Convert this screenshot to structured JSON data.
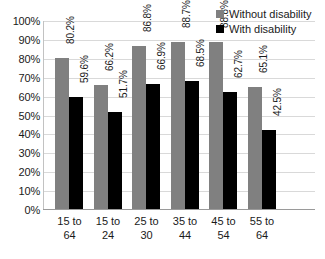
{
  "chart_data": {
    "type": "bar",
    "title": "",
    "xlabel": "",
    "ylabel": "",
    "categories": [
      "15 to 64",
      "15 to 24",
      "25 to 30",
      "35 to 44",
      "45 to 54",
      "55 to 64"
    ],
    "category_lines": [
      [
        "15 to",
        "64"
      ],
      [
        "15 to",
        "24"
      ],
      [
        "25 to",
        "30"
      ],
      [
        "35 to",
        "44"
      ],
      [
        "45 to",
        "54"
      ],
      [
        "55 to",
        "64"
      ]
    ],
    "series": [
      {
        "name": "Without disability",
        "color": "#808080",
        "values": [
          80.2,
          66.2,
          86.8,
          88.7,
          88.8,
          65.1
        ],
        "labels": [
          "80.2%",
          "66.2%",
          "86.8%",
          "88.7%",
          "88.8%",
          "65.1%"
        ]
      },
      {
        "name": "With disability",
        "color": "#000000",
        "values": [
          59.6,
          51.7,
          66.9,
          68.5,
          62.7,
          42.5
        ],
        "labels": [
          "59.6%",
          "51.7%",
          "66.9%",
          "68.5%",
          "62.7%",
          "42.5%"
        ]
      }
    ],
    "ylim": [
      0,
      100
    ],
    "y_ticks": [
      100,
      90,
      80,
      70,
      60,
      50,
      40,
      30,
      20,
      10,
      0
    ],
    "y_tick_labels": [
      "100%",
      "90%",
      "80%",
      "70%",
      "60%",
      "50%",
      "40%",
      "30%",
      "20%",
      "10%",
      "0%"
    ],
    "grid": true,
    "legend_position": "top-right"
  },
  "legend": {
    "entries": [
      {
        "label": "Without disability",
        "color": "#808080"
      },
      {
        "label": "With disability",
        "color": "#000000"
      }
    ]
  },
  "caption": {
    "text": ""
  }
}
